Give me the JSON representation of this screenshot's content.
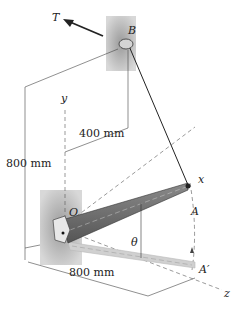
{
  "labels": {
    "force": "T",
    "point_b": "B",
    "point_a": "A",
    "point_a_prime": "A′",
    "origin": "O",
    "axis_x": "x",
    "axis_y": "y",
    "axis_z": "z",
    "angle": "θ",
    "dim_horizontal": "400 mm",
    "dim_vertical": "800 mm",
    "dim_length": "800 mm"
  },
  "colors": {
    "wall": "#a8a8a8",
    "bar": "#6e6e6e",
    "bar_ghost": "#cfcfcf",
    "line": "#222222"
  }
}
